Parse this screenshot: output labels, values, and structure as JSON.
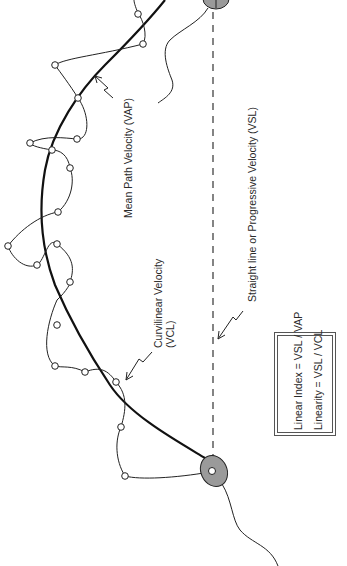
{
  "diagram": {
    "labels": {
      "vap": "Mean Path Velocity (VAP)",
      "vsl": "Straight line or Progressive Velocity (VSL)",
      "vcl_line1": "Curvilinear Velocity",
      "vcl_line2": "(VCL)"
    },
    "formulas": {
      "linear_index": "Linear Index = VSL / VAP",
      "linearity": "Linearity = VSL / VCL"
    },
    "elements": {
      "start_head": "sperm head (start position)",
      "end_head": "sperm head (end position)",
      "vcl_path": "curvilinear track with sampled positions",
      "vap_path": "smoothed average path",
      "vsl_path": "straight dashed line from start to end"
    },
    "colors": {
      "stroke": "#1a1a1a",
      "head_fill": "#9a9a9a",
      "text": "#2a2a2a",
      "background": "#ffffff"
    }
  }
}
